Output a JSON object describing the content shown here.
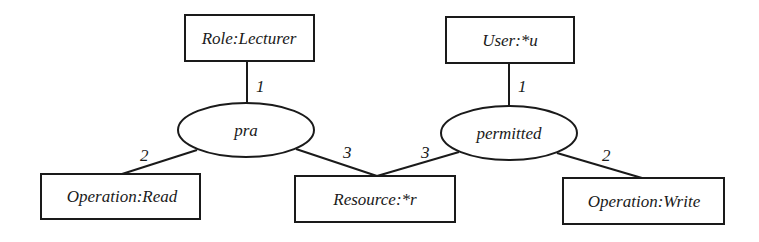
{
  "diagram": {
    "type": "conceptual-graph",
    "concepts": [
      {
        "id": "role",
        "label": "Role:Lecturer"
      },
      {
        "id": "user",
        "label": "User:*u"
      },
      {
        "id": "op_read",
        "label": "Operation:Read"
      },
      {
        "id": "resource",
        "label": "Resource:*r"
      },
      {
        "id": "op_write",
        "label": "Operation:Write"
      }
    ],
    "relations": [
      {
        "id": "pra",
        "label": "pra"
      },
      {
        "id": "permitted",
        "label": "permitted"
      }
    ],
    "edges": [
      {
        "from": "pra",
        "to": "role",
        "label": "1"
      },
      {
        "from": "pra",
        "to": "op_read",
        "label": "2"
      },
      {
        "from": "pra",
        "to": "resource",
        "label": "3"
      },
      {
        "from": "permitted",
        "to": "user",
        "label": "1"
      },
      {
        "from": "permitted",
        "to": "op_write",
        "label": "2"
      },
      {
        "from": "permitted",
        "to": "resource",
        "label": "3"
      }
    ],
    "colors": {
      "stroke": "#1a1a1a",
      "background": "#ffffff"
    }
  }
}
